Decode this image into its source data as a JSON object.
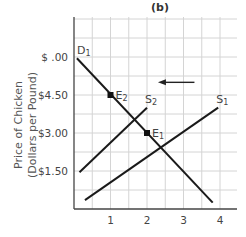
{
  "chart_data": {
    "type": "line",
    "title": "(b)",
    "xlabel": "",
    "ylabel": [
      "Price of Chicken",
      "(Dollars per Pound)"
    ],
    "xlim": [
      0,
      4.6
    ],
    "ylim": [
      0,
      6.6
    ],
    "grid": true,
    "x_ticks": [
      {
        "value": 1,
        "label": "1"
      },
      {
        "value": 2,
        "label": "2"
      },
      {
        "value": 3,
        "label": "3"
      },
      {
        "value": 4,
        "label": "4"
      }
    ],
    "y_ticks": [
      {
        "value": 6.0,
        "label": "$ .00"
      },
      {
        "value": 4.5,
        "label": "$4.50"
      },
      {
        "value": 3.0,
        "label": "$3.00"
      },
      {
        "value": 1.5,
        "label": "$1.50"
      }
    ],
    "series": [
      {
        "name": "D1",
        "label_main": "D",
        "label_sub": "1",
        "points": [
          [
            0.08,
            5.95
          ],
          [
            3.8,
            0.25
          ]
        ]
      },
      {
        "name": "S2",
        "label_main": "S",
        "label_sub": "2",
        "points": [
          [
            0.15,
            1.45
          ],
          [
            2.0,
            4.0
          ]
        ]
      },
      {
        "name": "S1",
        "label_main": "S",
        "label_sub": "1",
        "points": [
          [
            0.3,
            0.35
          ],
          [
            3.95,
            4.0
          ]
        ]
      }
    ],
    "points": [
      {
        "name": "E2",
        "label_main": "E",
        "label_sub": "2",
        "x": 1,
        "y": 4.5
      },
      {
        "name": "E1",
        "label_main": "E",
        "label_sub": "1",
        "x": 2,
        "y": 3.0
      }
    ],
    "annotations": [
      {
        "type": "arrow",
        "from": [
          3.3,
          5.0
        ],
        "to": [
          2.3,
          5.0
        ],
        "meaning": "supply shifts left from S1 to S2"
      }
    ]
  }
}
